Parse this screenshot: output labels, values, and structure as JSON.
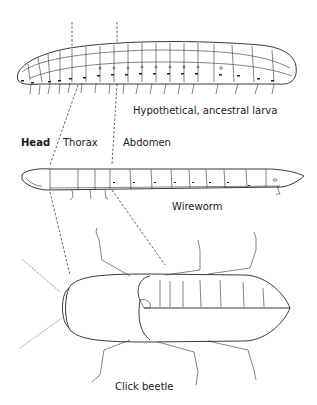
{
  "figure": {
    "labels": {
      "ancestral_larva": "Hypothetical, ancestral larva",
      "head": "Head",
      "thorax": "Thorax",
      "abdomen": "Abdomen",
      "wireworm": "Wireworm",
      "click_beetle": "Click beetle"
    },
    "drawings": [
      {
        "name": "ancestral-larva",
        "segments": 20,
        "legs_per_segment": 1
      },
      {
        "name": "wireworm",
        "segments": 14,
        "thoracic_legs": 3
      },
      {
        "name": "click-beetle",
        "legs": 6,
        "antennae": 2
      }
    ],
    "colors": {
      "ink": "#222222",
      "background": "#ffffff"
    }
  }
}
